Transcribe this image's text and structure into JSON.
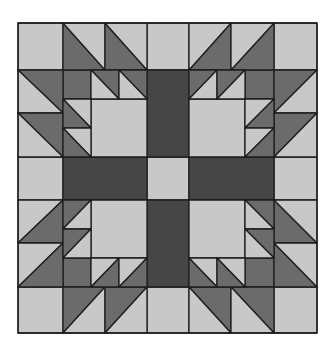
{
  "diagram": {
    "type": "quilt-block",
    "pattern": "bear-paw",
    "grid": {
      "columns": 7,
      "rows": 7
    },
    "colors": {
      "background": "#ffffff",
      "light": "#c8c8c8",
      "medium": "#6b6b6b",
      "dark": "#464646",
      "line": "#1e1e1e"
    },
    "bounds": {
      "x": [
        18,
        63,
        105,
        147,
        189,
        231,
        274,
        317
      ],
      "y": [
        23,
        70,
        113,
        157,
        200,
        243,
        287,
        333
      ]
    }
  },
  "shapes": {
    "squares": [
      {
        "id": "corner-tl",
        "x": 18,
        "y": 23,
        "w": 45,
        "h": 47,
        "fill": "light"
      },
      {
        "id": "corner-tr",
        "x": 274,
        "y": 23,
        "w": 43,
        "h": 47,
        "fill": "light"
      },
      {
        "id": "corner-bl",
        "x": 18,
        "y": 287,
        "w": 45,
        "h": 46,
        "fill": "light"
      },
      {
        "id": "corner-br",
        "x": 274,
        "y": 287,
        "w": 43,
        "h": 46,
        "fill": "light"
      },
      {
        "id": "edge-top-center",
        "x": 147,
        "y": 23,
        "w": 42,
        "h": 47,
        "fill": "light"
      },
      {
        "id": "edge-bottom-center",
        "x": 147,
        "y": 287,
        "w": 42,
        "h": 46,
        "fill": "light"
      },
      {
        "id": "edge-left-center",
        "x": 18,
        "y": 157,
        "w": 45,
        "h": 43,
        "fill": "light"
      },
      {
        "id": "edge-right-center",
        "x": 274,
        "y": 157,
        "w": 43,
        "h": 43,
        "fill": "light"
      },
      {
        "id": "center",
        "x": 147,
        "y": 157,
        "w": 42,
        "h": 43,
        "fill": "light"
      },
      {
        "id": "bar-top",
        "x": 147,
        "y": 70,
        "w": 42,
        "h": 87,
        "fill": "dark"
      },
      {
        "id": "bar-bottom",
        "x": 147,
        "y": 200,
        "w": 42,
        "h": 87,
        "fill": "dark"
      },
      {
        "id": "bar-left",
        "x": 63,
        "y": 157,
        "w": 84,
        "h": 43,
        "fill": "dark"
      },
      {
        "id": "bar-right",
        "x": 189,
        "y": 157,
        "w": 85,
        "h": 43,
        "fill": "dark"
      },
      {
        "id": "paw-tl-big",
        "x": 91,
        "y": 99,
        "w": 56,
        "h": 58,
        "fill": "light"
      },
      {
        "id": "paw-tl-small",
        "x": 63,
        "y": 70,
        "w": 28,
        "h": 29,
        "fill": "medium"
      },
      {
        "id": "paw-tr-big",
        "x": 189,
        "y": 99,
        "w": 56,
        "h": 58,
        "fill": "light"
      },
      {
        "id": "paw-tr-small",
        "x": 245,
        "y": 70,
        "w": 29,
        "h": 29,
        "fill": "medium"
      },
      {
        "id": "paw-bl-big",
        "x": 91,
        "y": 200,
        "w": 56,
        "h": 58,
        "fill": "light"
      },
      {
        "id": "paw-bl-small",
        "x": 63,
        "y": 258,
        "w": 28,
        "h": 29,
        "fill": "medium"
      },
      {
        "id": "paw-br-big",
        "x": 189,
        "y": 200,
        "w": 56,
        "h": 58,
        "fill": "light"
      },
      {
        "id": "paw-br-small",
        "x": 245,
        "y": 258,
        "w": 29,
        "h": 29,
        "fill": "medium"
      }
    ],
    "triangles": [
      {
        "id": "tl-top-1-dark",
        "points": "63,23 63,70 105,70",
        "fill": "medium"
      },
      {
        "id": "tl-top-1-light",
        "points": "63,23 105,23 105,70",
        "fill": "light"
      },
      {
        "id": "tl-top-2-dark",
        "points": "105,23 105,70 147,70",
        "fill": "medium"
      },
      {
        "id": "tl-top-2-light",
        "points": "105,23 147,23 147,70",
        "fill": "light"
      },
      {
        "id": "tl-left-1-dark",
        "points": "18,70 63,70 63,113",
        "fill": "medium"
      },
      {
        "id": "tl-left-1-light",
        "points": "18,70 18,113 63,113",
        "fill": "light"
      },
      {
        "id": "tl-left-2-dark",
        "points": "18,113 63,113 63,157",
        "fill": "medium"
      },
      {
        "id": "tl-left-2-light",
        "points": "18,113 18,157 63,157",
        "fill": "light"
      },
      {
        "id": "tl-paw-top-1-dark",
        "points": "91,70 119,70 119,99",
        "fill": "medium"
      },
      {
        "id": "tl-paw-top-1-light",
        "points": "91,70 91,99 119,99",
        "fill": "light"
      },
      {
        "id": "tl-paw-top-2-dark",
        "points": "119,70 147,70 147,99",
        "fill": "medium"
      },
      {
        "id": "tl-paw-top-2-light",
        "points": "119,70 119,99 147,99",
        "fill": "light"
      },
      {
        "id": "tl-paw-left-1-light",
        "points": "63,99 91,99 91,128",
        "fill": "light"
      },
      {
        "id": "tl-paw-left-1-dark",
        "points": "63,99 63,128 91,128",
        "fill": "medium"
      },
      {
        "id": "tl-paw-left-2-light",
        "points": "63,128 91,128 91,157",
        "fill": "light"
      },
      {
        "id": "tl-paw-left-2-dark",
        "points": "63,128 63,157 91,157",
        "fill": "medium"
      },
      {
        "id": "tr-top-1-dark",
        "points": "231,23 231,70 189,70",
        "fill": "medium"
      },
      {
        "id": "tr-top-1-light",
        "points": "189,23 231,23 189,70",
        "fill": "light"
      },
      {
        "id": "tr-top-2-dark",
        "points": "274,23 274,70 231,70",
        "fill": "medium"
      },
      {
        "id": "tr-top-2-light",
        "points": "231,23 274,23 231,70",
        "fill": "light"
      },
      {
        "id": "tr-right-1-dark",
        "points": "274,70 317,70 274,113",
        "fill": "medium"
      },
      {
        "id": "tr-right-1-light",
        "points": "317,70 317,113 274,113",
        "fill": "light"
      },
      {
        "id": "tr-right-2-dark",
        "points": "274,113 317,113 274,157",
        "fill": "medium"
      },
      {
        "id": "tr-right-2-light",
        "points": "317,113 317,157 274,157",
        "fill": "light"
      },
      {
        "id": "tr-paw-top-1-dark",
        "points": "189,70 217,70 189,99",
        "fill": "medium"
      },
      {
        "id": "tr-paw-top-1-light",
        "points": "217,70 217,99 189,99",
        "fill": "light"
      },
      {
        "id": "tr-paw-top-2-dark",
        "points": "217,70 245,70 217,99",
        "fill": "medium"
      },
      {
        "id": "tr-paw-top-2-light",
        "points": "245,70 245,99 217,99",
        "fill": "light"
      },
      {
        "id": "tr-paw-right-1-light",
        "points": "245,99 274,99 245,128",
        "fill": "light"
      },
      {
        "id": "tr-paw-right-1-dark",
        "points": "274,99 274,128 245,128",
        "fill": "medium"
      },
      {
        "id": "tr-paw-right-2-light",
        "points": "245,128 274,128 245,157",
        "fill": "light"
      },
      {
        "id": "tr-paw-right-2-dark",
        "points": "274,128 274,157 245,157",
        "fill": "medium"
      },
      {
        "id": "bl-left-1-light",
        "points": "18,200 63,200 18,243",
        "fill": "light"
      },
      {
        "id": "bl-left-1-dark",
        "points": "63,200 63,243 18,243",
        "fill": "medium"
      },
      {
        "id": "bl-left-2-light",
        "points": "18,243 63,243 18,287",
        "fill": "light"
      },
      {
        "id": "bl-left-2-dark",
        "points": "63,243 63,287 18,287",
        "fill": "medium"
      },
      {
        "id": "bl-bottom-1-dark",
        "points": "63,287 105,287 63,333",
        "fill": "medium"
      },
      {
        "id": "bl-bottom-1-light",
        "points": "105,287 105,333 63,333",
        "fill": "light"
      },
      {
        "id": "bl-bottom-2-dark",
        "points": "105,287 147,287 105,333",
        "fill": "medium"
      },
      {
        "id": "bl-bottom-2-light",
        "points": "147,287 147,333 105,333",
        "fill": "light"
      },
      {
        "id": "bl-paw-left-1-dark",
        "points": "63,200 91,200 63,229",
        "fill": "medium"
      },
      {
        "id": "bl-paw-left-1-light",
        "points": "91,200 91,229 63,229",
        "fill": "light"
      },
      {
        "id": "bl-paw-left-2-dark",
        "points": "63,229 91,229 63,258",
        "fill": "medium"
      },
      {
        "id": "bl-paw-left-2-light",
        "points": "91,229 91,258 63,258",
        "fill": "light"
      },
      {
        "id": "bl-paw-bottom-1-light",
        "points": "91,258 119,258 91,287",
        "fill": "light"
      },
      {
        "id": "bl-paw-bottom-1-dark",
        "points": "119,258 119,287 91,287",
        "fill": "medium"
      },
      {
        "id": "bl-paw-bottom-2-light",
        "points": "119,258 147,258 119,287",
        "fill": "light"
      },
      {
        "id": "bl-paw-bottom-2-dark",
        "points": "147,258 147,287 119,287",
        "fill": "medium"
      },
      {
        "id": "br-right-1-dark",
        "points": "274,200 274,243 317,243",
        "fill": "medium"
      },
      {
        "id": "br-right-1-light",
        "points": "274,200 317,200 317,243",
        "fill": "light"
      },
      {
        "id": "br-right-2-dark",
        "points": "274,243 274,287 317,287",
        "fill": "medium"
      },
      {
        "id": "br-right-2-light",
        "points": "274,243 317,243 317,287",
        "fill": "light"
      },
      {
        "id": "br-bottom-1-dark",
        "points": "189,287 231,287 231,333",
        "fill": "medium"
      },
      {
        "id": "br-bottom-1-light",
        "points": "189,287 189,333 231,333",
        "fill": "light"
      },
      {
        "id": "br-bottom-2-dark",
        "points": "231,287 274,287 274,333",
        "fill": "medium"
      },
      {
        "id": "br-bottom-2-light",
        "points": "231,287 231,333 274,333",
        "fill": "light"
      },
      {
        "id": "br-paw-right-1-dark",
        "points": "245,200 274,200 274,229",
        "fill": "medium"
      },
      {
        "id": "br-paw-right-1-light",
        "points": "245,200 245,229 274,229",
        "fill": "light"
      },
      {
        "id": "br-paw-right-2-dark",
        "points": "245,229 274,229 274,258",
        "fill": "medium"
      },
      {
        "id": "br-paw-right-2-light",
        "points": "245,229 245,258 274,258",
        "fill": "light"
      },
      {
        "id": "br-paw-bottom-1-light",
        "points": "189,258 217,258 217,287",
        "fill": "light"
      },
      {
        "id": "br-paw-bottom-1-dark",
        "points": "189,258 189,287 217,287",
        "fill": "medium"
      },
      {
        "id": "br-paw-bottom-2-light",
        "points": "217,258 245,258 245,287",
        "fill": "light"
      },
      {
        "id": "br-paw-bottom-2-dark",
        "points": "217,258 217,287 245,287",
        "fill": "medium"
      }
    ]
  }
}
